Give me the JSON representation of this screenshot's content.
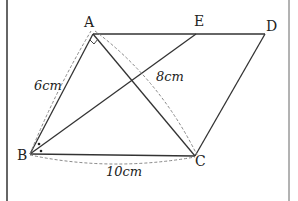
{
  "diagram": {
    "type": "geometry-parallelogram",
    "points": {
      "A": {
        "label": "A",
        "x": 93,
        "y": 34
      },
      "E": {
        "label": "E",
        "x": 196,
        "y": 34
      },
      "D": {
        "label": "D",
        "x": 265,
        "y": 34
      },
      "B": {
        "label": "B",
        "x": 30,
        "y": 154
      },
      "C": {
        "label": "C",
        "x": 195,
        "y": 156
      }
    },
    "segments": [
      "AD",
      "AB",
      "BC",
      "CD",
      "AC",
      "BE"
    ],
    "measurements": {
      "AB": "6cm",
      "AC": "8cm",
      "BC": "10cm"
    },
    "marks": {
      "right_angle_at": "A",
      "angle_bisector_dots_at": "B"
    },
    "colors": {
      "line": "#333333",
      "dashed": "#888888",
      "frame": "#444444"
    }
  }
}
